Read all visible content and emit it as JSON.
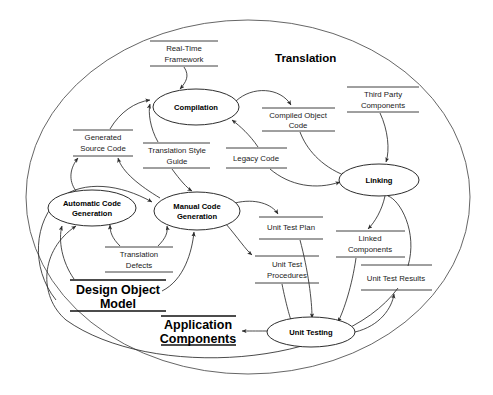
{
  "diagram": {
    "title": "Translation",
    "boundary_name": "translation-context-boundary",
    "processes": [
      {
        "id": "compilation",
        "label": "Compilation",
        "cx": 196,
        "cy": 107,
        "rx": 43,
        "ry": 18
      },
      {
        "id": "linking",
        "label": "Linking",
        "cx": 379,
        "cy": 180,
        "rx": 40,
        "ry": 16
      },
      {
        "id": "automatic-code-generation",
        "label_line1": "Automatic Code",
        "label_line2": "Generation",
        "cx": 92,
        "cy": 208,
        "rx": 44,
        "ry": 18
      },
      {
        "id": "manual-code-generation",
        "label_line1": "Manual Code",
        "label_line2": "Generation",
        "cx": 197,
        "cy": 211,
        "rx": 43,
        "ry": 19
      },
      {
        "id": "unit-testing",
        "label": "Unit Testing",
        "cx": 311,
        "cy": 332,
        "rx": 44,
        "ry": 15
      }
    ],
    "stores": [
      {
        "id": "real-time-framework",
        "line1": "Real-Time",
        "line2": "Framework",
        "x1": 150,
        "x2": 218,
        "top": 41,
        "bottom": 66
      },
      {
        "id": "compiled-object-code",
        "line1": "Compiled Object",
        "line2": "Code",
        "x1": 262,
        "x2": 335,
        "top": 108,
        "bottom": 131
      },
      {
        "id": "third-party-components",
        "line1": "Third Party",
        "line2": "Components",
        "x1": 347,
        "x2": 419,
        "top": 87,
        "bottom": 112
      },
      {
        "id": "generated-source-code",
        "line1": "Generated",
        "line2": "Source Code",
        "x1": 73,
        "x2": 133,
        "top": 130,
        "bottom": 156
      },
      {
        "id": "translation-style-guide",
        "line1": "Translation Style",
        "line2": "Guide",
        "x1": 143,
        "x2": 210,
        "top": 143,
        "bottom": 168
      },
      {
        "id": "legacy-code",
        "line1": "Legacy Code",
        "line2": "",
        "x1": 226,
        "x2": 287,
        "top": 148,
        "bottom": 168
      },
      {
        "id": "translation-defects",
        "line1": "Translation",
        "line2": "Defects",
        "x1": 105,
        "x2": 173,
        "top": 247,
        "bottom": 272
      },
      {
        "id": "unit-test-plan",
        "line1": "Unit Test Plan",
        "line2": "",
        "x1": 259,
        "x2": 323,
        "top": 217,
        "bottom": 239
      },
      {
        "id": "unit-test-procedures",
        "line1": "Unit Test",
        "line2": "Procedures",
        "x1": 255,
        "x2": 319,
        "top": 256,
        "bottom": 283
      },
      {
        "id": "linked-components",
        "line1": "Linked",
        "line2": "Components",
        "x1": 336,
        "x2": 405,
        "top": 231,
        "bottom": 257
      },
      {
        "id": "unit-test-results",
        "line1": "Unit Test Results",
        "line2": "",
        "x1": 361,
        "x2": 432,
        "top": 265,
        "bottom": 290
      }
    ],
    "big_stores": [
      {
        "id": "design-object-model",
        "line1": "Design Object",
        "line2": "Model",
        "x1": 70,
        "x2": 166,
        "top": 280,
        "bottom": 311
      },
      {
        "id": "application-components",
        "line1": "Application",
        "line2": "Components",
        "x1": 161,
        "x2": 236,
        "top": 316,
        "bottom": 345
      }
    ],
    "colors": {
      "stroke": "#2b2b2b",
      "boundary": "#555555",
      "text": "#000000",
      "background": "#ffffff"
    }
  }
}
